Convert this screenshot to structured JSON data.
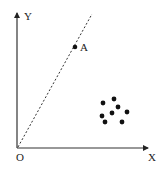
{
  "diagram": {
    "type": "scatter-with-line",
    "colors": {
      "ink": "#222222",
      "background": "#ffffff"
    },
    "axes": {
      "origin_label": "O",
      "x_label": "X",
      "y_label": "Y",
      "origin_px": [
        17,
        148
      ],
      "x_end_px": [
        148,
        148
      ],
      "y_end_px": [
        17,
        13
      ]
    },
    "dashed_line": {
      "from_px": [
        18,
        147
      ],
      "to_px": [
        92,
        14
      ]
    },
    "point_A": {
      "label": "A",
      "px": [
        75,
        47
      ]
    },
    "cluster_points_px": [
      [
        103,
        103
      ],
      [
        114,
        99
      ],
      [
        118,
        107
      ],
      [
        127,
        112
      ],
      [
        102,
        116
      ],
      [
        112,
        113
      ],
      [
        105,
        122
      ],
      [
        122,
        122
      ]
    ]
  }
}
